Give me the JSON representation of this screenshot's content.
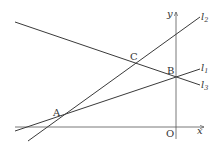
{
  "diagram": {
    "type": "coordinate-geometry",
    "axes": {
      "x_label": "x",
      "y_label": "y",
      "origin_label": "O"
    },
    "points": {
      "A": "A",
      "B": "B",
      "C": "C"
    },
    "lines": [
      {
        "name": "l",
        "sub": "1",
        "passes_through": [
          "A",
          "B"
        ]
      },
      {
        "name": "l",
        "sub": "2",
        "passes_through": [
          "A",
          "C"
        ]
      },
      {
        "name": "l",
        "sub": "3",
        "passes_through": [
          "C",
          "B"
        ]
      }
    ],
    "colors": {
      "line": "#3a3a3a",
      "axis": "#555555",
      "text": "#333333"
    }
  }
}
